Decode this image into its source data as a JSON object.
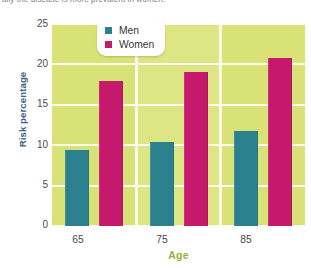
{
  "caption": {
    "text": "ally the disease is more prevalent in women."
  },
  "legend": {
    "position": "top-center",
    "entries": [
      {
        "label": "Men",
        "color": "#2c818f",
        "icon": "square-swatch-icon"
      },
      {
        "label": "Women",
        "color": "#c6186c",
        "icon": "square-swatch-icon"
      }
    ]
  },
  "axes": {
    "ylabel": "Risk percentage",
    "xlabel": "Age",
    "yticks": [
      "0",
      "5",
      "10",
      "15",
      "20",
      "25"
    ],
    "xticks": [
      "65",
      "75",
      "85"
    ]
  },
  "colors": {
    "plot_background": "#d9e276",
    "panel_alt": "#dde584",
    "gridline": "#fdfdf4",
    "men": "#2c818f",
    "women": "#c6186c",
    "xlabel": "#8fb23c",
    "ylabel": "#3b5e86"
  },
  "chart_data": {
    "type": "bar",
    "title": "",
    "subtitle": "",
    "xlabel": "Age",
    "ylabel": "Risk percentage",
    "categories": [
      "65",
      "75",
      "85"
    ],
    "series": [
      {
        "name": "Men",
        "color": "#2c818f",
        "values": [
          9.4,
          10.4,
          11.8
        ]
      },
      {
        "name": "Women",
        "color": "#c6186c",
        "values": [
          18.0,
          19.0,
          20.8
        ]
      }
    ],
    "ylim": [
      0,
      25
    ],
    "ytick_values": [
      0,
      5,
      10,
      15,
      20,
      25
    ],
    "grid": "horizontal",
    "legend_position": "top-center",
    "annotations": []
  }
}
